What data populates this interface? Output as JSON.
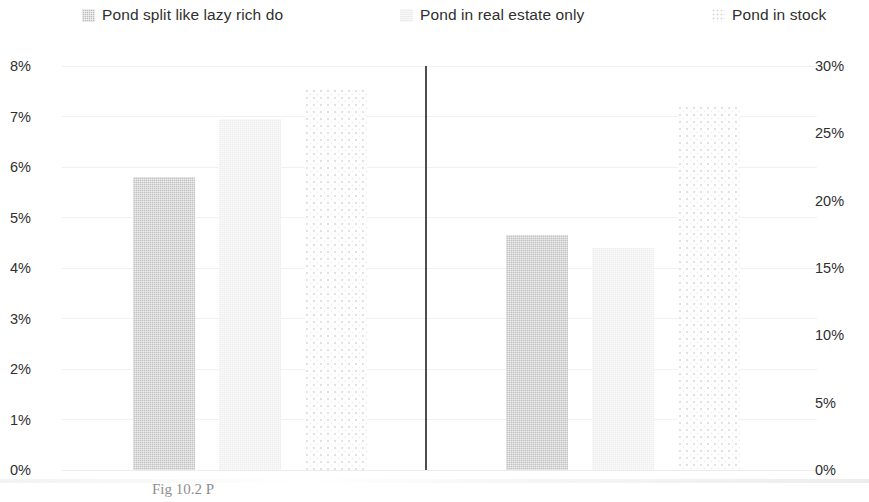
{
  "legend": {
    "items": [
      {
        "label": "Pond split like lazy rich do",
        "swatch": "checkered-gray-square-icon",
        "color": "#bdbdbd"
      },
      {
        "label": "Pond in real estate only",
        "swatch": "light-gray-square-icon",
        "color": "#ededed"
      },
      {
        "label": "Pond in stock",
        "swatch": "dotted-square-icon",
        "color": "#fdfdfd"
      }
    ]
  },
  "caption": {
    "text": "Fig 10.2 P"
  },
  "chart_data": {
    "type": "bar",
    "title": "",
    "subtitle": "",
    "xlabel": "",
    "ylabel": "",
    "grid": true,
    "legend_position": "top",
    "categories": [
      "Group 1",
      "Group 2"
    ],
    "series": [
      {
        "name": "Pond split like lazy rich do",
        "axis": "left",
        "values": [
          5.8,
          4.65
        ],
        "unit": "%",
        "color": "#c2c2c2",
        "pattern": "checkered"
      },
      {
        "name": "Pond in real estate only",
        "axis": "left",
        "values": [
          6.95,
          4.4
        ],
        "unit": "%",
        "color": "#ededed",
        "pattern": "solid-light"
      },
      {
        "name": "Pond in stock",
        "axis": "right",
        "values": [
          28.3,
          27.0
        ],
        "unit": "%",
        "color": "#fdfdfd",
        "pattern": "dotted"
      }
    ],
    "left_axis": {
      "label": "",
      "ticks": [
        "0%",
        "1%",
        "2%",
        "3%",
        "4%",
        "5%",
        "6%",
        "7%",
        "8%"
      ],
      "values": [
        0,
        1,
        2,
        3,
        4,
        5,
        6,
        7,
        8
      ],
      "ylim": [
        0,
        8
      ]
    },
    "right_axis": {
      "label": "",
      "ticks": [
        "0%",
        "5%",
        "10%",
        "15%",
        "20%",
        "25%",
        "30%"
      ],
      "values": [
        0,
        5,
        10,
        15,
        20,
        25,
        30
      ],
      "ylim": [
        0,
        30
      ]
    }
  }
}
